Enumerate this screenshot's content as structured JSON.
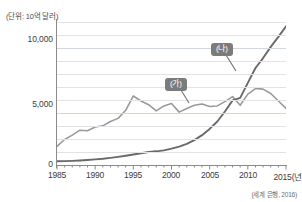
{
  "figure": {
    "unit_label": "(단위: 10억 달러)",
    "source_note": "(세계 은행, 2016)"
  },
  "callouts": {
    "ga": "(가)",
    "na": "(나)"
  },
  "chart_data": {
    "type": "line",
    "title": "",
    "xlabel": "2015(년)",
    "ylabel": "(단위: 10억 달러)",
    "xlim": [
      1985,
      2015
    ],
    "ylim": [
      0,
      11500
    ],
    "grid": true,
    "grid_step": 1000,
    "legend_position": "inline-callout",
    "yticks": [
      0,
      5000,
      10000
    ],
    "ytick_labels": [
      "0",
      "5,000",
      "10,000"
    ],
    "xticks": [
      1985,
      1990,
      1995,
      2000,
      2005,
      2010,
      2015
    ],
    "xtick_labels": [
      "1985",
      "1990",
      "1995",
      "2000",
      "2005",
      "2010",
      "2015(년)"
    ],
    "x": [
      1985,
      1986,
      1987,
      1988,
      1989,
      1990,
      1991,
      1992,
      1993,
      1994,
      1995,
      1996,
      1997,
      1998,
      1999,
      2000,
      2001,
      2002,
      2003,
      2004,
      2005,
      2006,
      2007,
      2008,
      2009,
      2010,
      2011,
      2012,
      2013,
      2014,
      2015
    ],
    "series": [
      {
        "name": "(가)",
        "color": "#9a9a9a",
        "values": [
          1500,
          2050,
          2400,
          2800,
          2750,
          3050,
          3150,
          3500,
          3750,
          4400,
          5550,
          5150,
          4850,
          4350,
          4750,
          4950,
          4250,
          4550,
          4800,
          4900,
          4700,
          4750,
          5100,
          5500,
          4800,
          5700,
          6150,
          6100,
          5750,
          5150,
          4550
        ]
      },
      {
        "name": "(나)",
        "color": "#6a6a6a",
        "values": [
          300,
          310,
          330,
          360,
          400,
          450,
          500,
          570,
          650,
          740,
          840,
          950,
          1050,
          1100,
          1180,
          1320,
          1480,
          1700,
          2000,
          2400,
          2900,
          3500,
          4300,
          5200,
          5400,
          6600,
          7800,
          8600,
          9500,
          10300,
          11150
        ]
      }
    ]
  }
}
